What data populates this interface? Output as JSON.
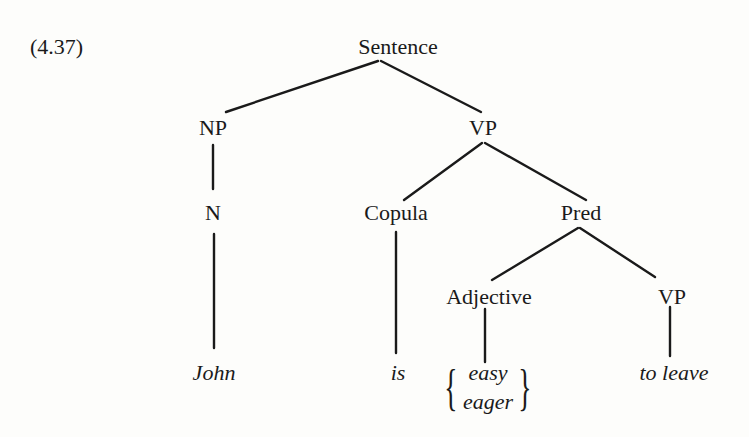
{
  "example_number": "(4.37)",
  "nodes": {
    "sentence": "Sentence",
    "np": "NP",
    "vp": "VP",
    "n": "N",
    "copula": "Copula",
    "pred": "Pred",
    "adjective": "Adjective",
    "vp2": "VP"
  },
  "leaves": {
    "john": "John",
    "is": "is",
    "adjective_options": [
      "easy",
      "eager"
    ],
    "to_leave": "to leave"
  },
  "colors": {
    "ink": "#1a1a1a",
    "paper": "#fdfdfb"
  }
}
